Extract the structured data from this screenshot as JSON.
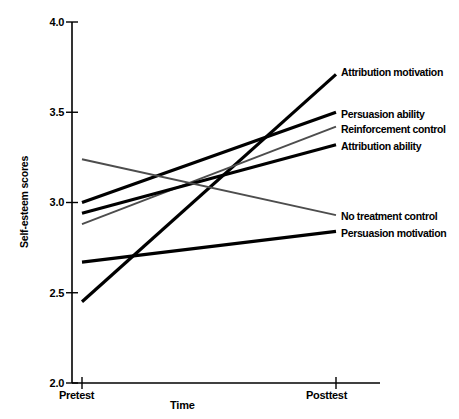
{
  "chart_data": {
    "type": "line",
    "title": "",
    "xlabel": "Time",
    "ylabel": "Self-esteem scores",
    "categories": [
      "Pretest",
      "Posttest"
    ],
    "x": [
      0,
      1
    ],
    "ylim": [
      2.0,
      4.0
    ],
    "yticks": [
      "2.0",
      "2.5",
      "3.0",
      "3.5",
      "4.0"
    ],
    "ytick_values": [
      2.0,
      2.5,
      3.0,
      3.5,
      4.0
    ],
    "xticks": [
      "Pretest",
      "Posttest"
    ],
    "grid": false,
    "legend_position": "right-inline-labels",
    "series": [
      {
        "name": "Attribution motivation",
        "values": [
          2.45,
          3.71
        ],
        "color": "#000000",
        "width": 3.2,
        "label_x": 341,
        "label_y": 66
      },
      {
        "name": "Persuasion ability",
        "values": [
          3.0,
          3.5
        ],
        "color": "#000000",
        "width": 3.2,
        "label_x": 341,
        "label_y": 108
      },
      {
        "name": "Reinforcement control",
        "values": [
          2.88,
          3.42
        ],
        "color": "#4d4d4d",
        "width": 2.0,
        "label_x": 341,
        "label_y": 123
      },
      {
        "name": "Attribution ability",
        "values": [
          2.94,
          3.32
        ],
        "color": "#000000",
        "width": 3.2,
        "label_x": 341,
        "label_y": 140
      },
      {
        "name": "No treatment control",
        "values": [
          3.24,
          2.93
        ],
        "color": "#4d4d4d",
        "width": 2.0,
        "label_x": 341,
        "label_y": 210
      },
      {
        "name": "Persuasion motivation",
        "values": [
          2.67,
          2.84
        ],
        "color": "#000000",
        "width": 3.2,
        "label_x": 341,
        "label_y": 227
      }
    ]
  },
  "axes": {
    "ylabel": "Self-esteem scores",
    "xlabel": "Time",
    "ytick_labels": [
      "4.0",
      "3.5",
      "3.0",
      "2.5",
      "2.0"
    ],
    "xtick_labels": [
      "Pretest",
      "Posttest"
    ]
  }
}
